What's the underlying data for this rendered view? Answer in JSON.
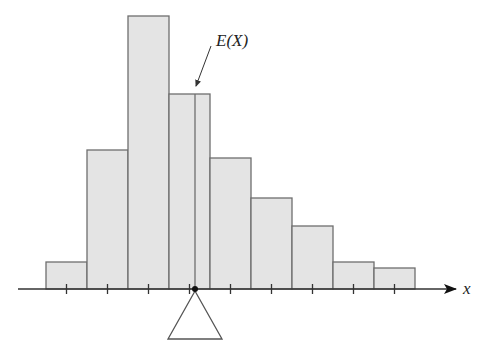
{
  "figure": {
    "mean_label": "E(X)",
    "axis_label": "x",
    "colors": {
      "bar_fill": "#e4e4e4",
      "bar_stroke": "#6e6e6e",
      "axis": "#333333",
      "fulcrum_dot": "#111111"
    }
  },
  "chart_data": {
    "type": "bar",
    "title": "",
    "xlabel": "x",
    "ylabel": "",
    "categories": [
      "1",
      "2",
      "3",
      "4",
      "5",
      "6",
      "7",
      "8",
      "9"
    ],
    "values": [
      27,
      139,
      273,
      195,
      131,
      91,
      63,
      27,
      21
    ],
    "value_units": "relative bar height (pixels above axis)",
    "annotations": [
      {
        "text": "E(X)",
        "points_to": "mean position, slightly left of bar 4 right edge",
        "x_position_category_index": 3.65
      }
    ],
    "fulcrum": {
      "shape": "triangle",
      "position": "E(X)"
    },
    "grid": false,
    "legend": null
  }
}
